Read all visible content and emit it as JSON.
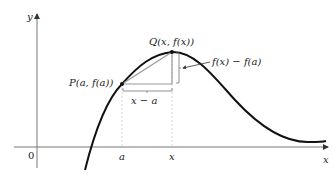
{
  "diagram": {
    "axes": {
      "x_label": "x",
      "y_label": "y",
      "origin_label": "0"
    },
    "points": {
      "P": {
        "label": "P(a, f(a))"
      },
      "Q": {
        "label": "Q(x, f(x))"
      }
    },
    "ticks": {
      "a": "a",
      "x": "x"
    },
    "annotations": {
      "run": "x − a",
      "rise": "f(x) − f(a)"
    },
    "colors": {
      "curve": "#111111",
      "axis": "#777777",
      "secant": "#999999",
      "guide": "#cccccc"
    }
  }
}
